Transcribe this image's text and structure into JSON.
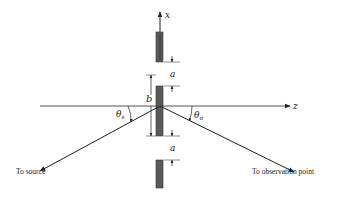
{
  "diagram": {
    "type": "double-slit geometry",
    "axes": {
      "x_label": "x",
      "z_label": "z"
    },
    "dimensions": {
      "gap_top_label": "a",
      "gap_bottom_label": "a",
      "spacing_label": "b"
    },
    "angles": {
      "source_angle_label": "θ",
      "source_angle_sub": "s",
      "observation_angle_label": "θ",
      "observation_angle_sub": "o"
    },
    "captions": {
      "source": "To source",
      "observation": "To observation point"
    },
    "colors": {
      "slit_fill": "#5a5a5a",
      "line": "#333333",
      "background": "#ffffff"
    }
  }
}
